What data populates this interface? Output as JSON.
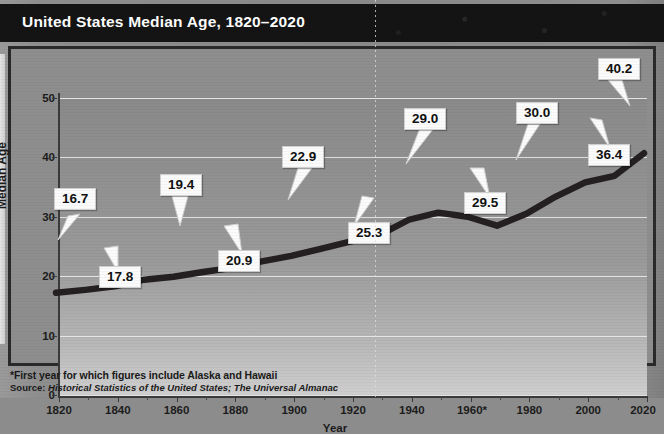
{
  "title": "United States Median Age, 1820–2020",
  "footnotes": {
    "asterisk": "*First year for which figures include Alaska and Hawaii",
    "source_prefix": "Source: ",
    "source_italic": "Historical Statistics of the United States; The Universal Almanac"
  },
  "colors": {
    "title_bar": "#141414",
    "title_text": "#ffffff",
    "line": "#241f20",
    "grid": "#e9e9e9",
    "callout_bg": "#fbfbfb",
    "axis": "#3a3a3a",
    "plot_bg_top": "#8a8a8a",
    "plot_bg_bottom": "#cfcfcf"
  },
  "chart_data": {
    "type": "line",
    "title": "United States Median Age, 1820–2020",
    "xlabel": "Year",
    "ylabel": "Median Age",
    "xlim": [
      1820,
      2020
    ],
    "ylim": [
      0,
      50
    ],
    "ytick_labels": [
      "0",
      "10",
      "20",
      "30",
      "40",
      "50"
    ],
    "yticks": [
      0,
      10,
      20,
      30,
      40,
      50
    ],
    "xtick_labels": [
      "1820",
      "1840",
      "1860",
      "1880",
      "1900",
      "1920",
      "1940",
      "1960*",
      "1980",
      "2000",
      "2020"
    ],
    "xticks": [
      1820,
      1840,
      1860,
      1880,
      1900,
      1920,
      1940,
      1960,
      1980,
      2000,
      2020
    ],
    "grid": "horizontal",
    "legend": "none",
    "x": [
      1820,
      1830,
      1840,
      1850,
      1860,
      1870,
      1880,
      1890,
      1900,
      1910,
      1920,
      1930,
      1940,
      1950,
      1960,
      1970,
      1980,
      1990,
      2000,
      2010,
      2020
    ],
    "values": [
      16.7,
      17.2,
      17.8,
      18.9,
      19.4,
      20.2,
      20.9,
      22.0,
      22.9,
      24.1,
      25.3,
      26.4,
      29.0,
      30.2,
      29.5,
      28.0,
      30.0,
      32.9,
      35.3,
      36.4,
      40.2
    ],
    "series": [
      {
        "name": "Median Age",
        "values": [
          16.7,
          17.2,
          17.8,
          18.9,
          19.4,
          20.2,
          20.9,
          22.0,
          22.9,
          24.1,
          25.3,
          26.4,
          29.0,
          30.2,
          29.5,
          28.0,
          30.0,
          32.9,
          35.3,
          36.4,
          40.2
        ]
      }
    ],
    "annotations": [
      {
        "label": "16.7",
        "year": 1820,
        "value": 16.7
      },
      {
        "label": "17.8",
        "year": 1840,
        "value": 17.8
      },
      {
        "label": "19.4",
        "year": 1860,
        "value": 19.4
      },
      {
        "label": "20.9",
        "year": 1880,
        "value": 20.9
      },
      {
        "label": "22.9",
        "year": 1900,
        "value": 22.9
      },
      {
        "label": "25.3",
        "year": 1920,
        "value": 25.3
      },
      {
        "label": "29.0",
        "year": 1940,
        "value": 29.0
      },
      {
        "label": "29.5",
        "year": 1960,
        "value": 29.5
      },
      {
        "label": "30.0",
        "year": 1980,
        "value": 30.0
      },
      {
        "label": "36.4",
        "year": 2010,
        "value": 36.4
      },
      {
        "label": "40.2",
        "year": 2020,
        "value": 40.2
      }
    ]
  }
}
